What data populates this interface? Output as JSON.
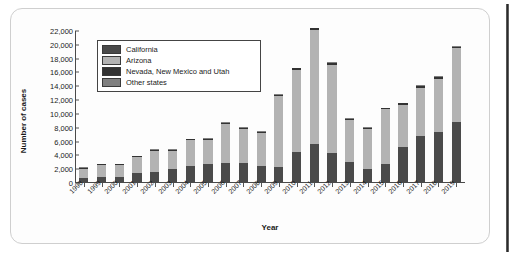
{
  "chart_data": {
    "type": "bar",
    "subtype": "stacked-bar",
    "title": "",
    "xlabel": "Year",
    "ylabel": "Number of cases",
    "ylim": [
      0,
      22000
    ],
    "ytick_step": 2000,
    "grid": false,
    "legend_position": "top-left-inside",
    "ytick_labels": [
      "0",
      "2,000",
      "4,000",
      "6,000",
      "8,000",
      "10,000",
      "12,000",
      "14,000",
      "16,000",
      "18,000",
      "20,000",
      "22,000"
    ],
    "ytick_values": [
      0,
      2000,
      4000,
      6000,
      8000,
      10000,
      12000,
      14000,
      16000,
      18000,
      20000,
      22000
    ],
    "categories": [
      "1998",
      "1999",
      "2000",
      "2001",
      "2002",
      "2003",
      "2004",
      "2005",
      "2006",
      "2007",
      "2008",
      "2009",
      "2010",
      "2011",
      "2012",
      "2013",
      "2014",
      "2015",
      "2016",
      "2017",
      "2018",
      "2019"
    ],
    "series": [
      {
        "name": "California",
        "color": "#4a4a4a",
        "values": [
          700,
          850,
          800,
          1400,
          1600,
          2000,
          2500,
          2700,
          2950,
          2850,
          2400,
          2300,
          4450,
          5600,
          4300,
          3050,
          2050,
          2800,
          5200,
          6800,
          7350,
          8800
        ]
      },
      {
        "name": "Arizona",
        "color": "#b3b3b3",
        "values": [
          1350,
          1750,
          1800,
          2350,
          3100,
          2650,
          3700,
          3600,
          5650,
          4950,
          4850,
          10300,
          11950,
          16550,
          12850,
          6050,
          5800,
          7850,
          6150,
          7000,
          7750,
          10700
        ]
      },
      {
        "name": "Nevada, New Mexico and Utah",
        "color": "#333333",
        "values": [
          100,
          100,
          100,
          120,
          130,
          120,
          130,
          130,
          150,
          150,
          150,
          150,
          200,
          250,
          250,
          150,
          130,
          150,
          180,
          220,
          220,
          250
        ]
      },
      {
        "name": "Other states",
        "color": "#808080",
        "values": [
          100,
          100,
          100,
          100,
          100,
          100,
          100,
          100,
          100,
          100,
          100,
          100,
          100,
          100,
          100,
          100,
          100,
          100,
          100,
          100,
          100,
          100
        ]
      }
    ],
    "totals": [
      2250,
      2800,
      2800,
      3970,
      4930,
      4870,
      6430,
      6530,
      8850,
      8050,
      7500,
      12850,
      16700,
      22500,
      17500,
      9350,
      8080,
      10900,
      11630,
      14120,
      15420,
      19850
    ]
  },
  "legend": {
    "items": [
      {
        "label": "California",
        "color": "#4a4a4a"
      },
      {
        "label": "Arizona",
        "color": "#b3b3b3"
      },
      {
        "label": "Nevada, New Mexico and Utah",
        "color": "#333333"
      },
      {
        "label": "Other states",
        "color": "#808080"
      }
    ]
  },
  "axes": {
    "y_title": "Number of cases",
    "x_title": "Year"
  }
}
